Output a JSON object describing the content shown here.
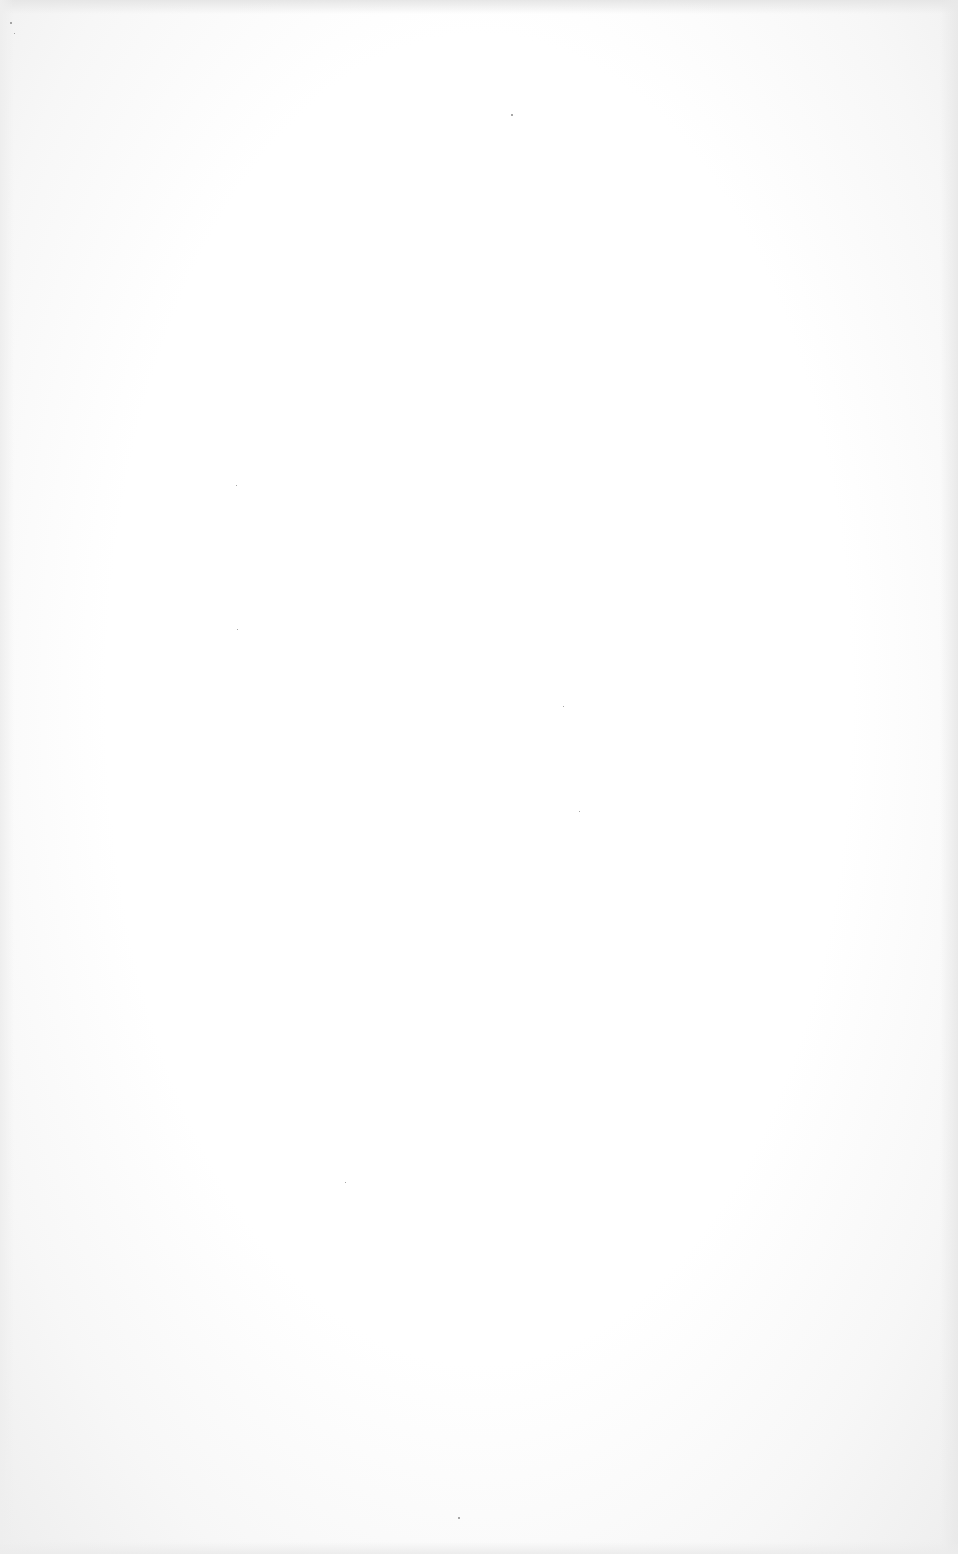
{
  "document": {
    "type": "blank-scanned-page",
    "text_content": [],
    "background_color": "#ffffff",
    "edge_shade_color": "#e8e8e8"
  },
  "specks": [
    {
      "x": 10,
      "y": 22,
      "size": 2
    },
    {
      "x": 511,
      "y": 114,
      "size": 2
    },
    {
      "x": 14,
      "y": 33,
      "size": 1
    },
    {
      "x": 236,
      "y": 485,
      "size": 1
    },
    {
      "x": 579,
      "y": 811,
      "size": 1
    },
    {
      "x": 458,
      "y": 1517,
      "size": 2
    },
    {
      "x": 237,
      "y": 629,
      "size": 1
    },
    {
      "x": 563,
      "y": 706,
      "size": 1
    },
    {
      "x": 345,
      "y": 1182,
      "size": 1
    }
  ]
}
